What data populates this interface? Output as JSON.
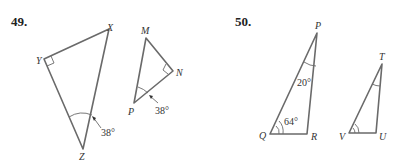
{
  "problems": [
    {
      "number": "49.",
      "triangles": [
        {
          "name": "XYZ",
          "vertices": {
            "X": "X",
            "Y": "Y",
            "Z": "Z"
          },
          "right_angle_at": "Y",
          "angle_label": "38°",
          "angle_at": "Z"
        },
        {
          "name": "MNP",
          "vertices": {
            "M": "M",
            "N": "N",
            "P": "P"
          },
          "right_angle_at": "N",
          "angle_label": "38°",
          "angle_at": "P"
        }
      ]
    },
    {
      "number": "50.",
      "triangles": [
        {
          "name": "PQR",
          "vertices": {
            "P": "P",
            "Q": "Q",
            "R": "R"
          },
          "angle_labels": {
            "P": "20°",
            "Q": "64°"
          }
        },
        {
          "name": "TUV",
          "vertices": {
            "T": "T",
            "U": "U",
            "V": "V"
          },
          "marked_angles": [
            "T",
            "V"
          ]
        }
      ]
    }
  ]
}
